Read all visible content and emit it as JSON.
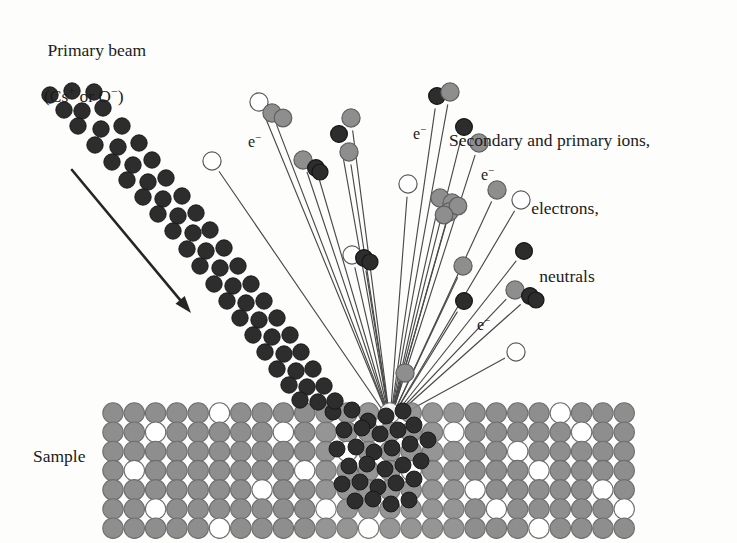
{
  "figure": {
    "kind": "sims-sputtering-schematic",
    "width": 737,
    "height": 543,
    "background": "#fdfdfc"
  },
  "labels": {
    "primary_beam": {
      "line1": "Primary beam",
      "line2": "(Cs+ or O−)",
      "line2_parts": {
        "open": "(Cs",
        "sup1": "+",
        "mid": " or O",
        "sup2": "−",
        "close": ")"
      }
    },
    "secondary": {
      "line1": "Secondary and primary ions,",
      "line2": "electrons,",
      "line3": "neutrals"
    },
    "sample": "Sample",
    "electron": "e",
    "electron_sup": "−"
  },
  "colors": {
    "ink": "#1b1b1b",
    "beam_particle": "#2d2d2d",
    "beam_particle_edge": "#151515",
    "lattice_atom": "#8e8e8e",
    "lattice_atom_edge": "#6f6f6f",
    "vacancy_fill": "#ffffff",
    "vacancy_edge": "#6f6f6f",
    "ejected_gray": "#8e8e8e",
    "ejected_gray_edge": "#5f5f5f",
    "ejected_dark": "#2d2d2d",
    "ejected_open": "#ffffff",
    "ray": "#4a4a4a",
    "arrow": "#262626",
    "background": "#fdfdfc"
  },
  "geometry": {
    "impact_point": {
      "x": 390,
      "y": 421
    },
    "arrow": {
      "x1": 72,
      "y1": 170,
      "x2": 191,
      "y2": 313,
      "width": 2.6
    },
    "lattice": {
      "x_start": 113,
      "y_start": 413,
      "pitch_x": 21.3,
      "pitch_y": 19.2,
      "radius": 10.2,
      "cols": 25,
      "rows": 7,
      "vacancies": [
        [
          0,
          5
        ],
        [
          0,
          13
        ],
        [
          0,
          21
        ],
        [
          1,
          2
        ],
        [
          1,
          8
        ],
        [
          1,
          16
        ],
        [
          1,
          22
        ],
        [
          2,
          11
        ],
        [
          2,
          19
        ],
        [
          3,
          1
        ],
        [
          3,
          9
        ],
        [
          3,
          14
        ],
        [
          3,
          20
        ],
        [
          4,
          7
        ],
        [
          4,
          17
        ],
        [
          4,
          23
        ],
        [
          5,
          2
        ],
        [
          5,
          10
        ],
        [
          5,
          18
        ],
        [
          5,
          24
        ],
        [
          6,
          5
        ],
        [
          6,
          12
        ],
        [
          6,
          20
        ]
      ],
      "crater_cols": [
        10,
        11,
        12,
        13,
        14,
        15,
        16
      ]
    }
  },
  "chart_data": {
    "type": "scatter",
    "beam_particles": [
      [
        50,
        95
      ],
      [
        72,
        91
      ],
      [
        94,
        92
      ],
      [
        64,
        110
      ],
      [
        82,
        111
      ],
      [
        103,
        108
      ],
      [
        78,
        126
      ],
      [
        101,
        129
      ],
      [
        122,
        126
      ],
      [
        95,
        145
      ],
      [
        118,
        147
      ],
      [
        139,
        143
      ],
      [
        112,
        162
      ],
      [
        133,
        165
      ],
      [
        152,
        160
      ],
      [
        127,
        180
      ],
      [
        148,
        182
      ],
      [
        166,
        178
      ],
      [
        143,
        197
      ],
      [
        163,
        199
      ],
      [
        182,
        196
      ],
      [
        158,
        214
      ],
      [
        178,
        216
      ],
      [
        196,
        213
      ],
      [
        173,
        231
      ],
      [
        193,
        233
      ],
      [
        210,
        230
      ],
      [
        187,
        249
      ],
      [
        206,
        251
      ],
      [
        224,
        248
      ],
      [
        200,
        266
      ],
      [
        220,
        268
      ],
      [
        238,
        266
      ],
      [
        214,
        284
      ],
      [
        233,
        286
      ],
      [
        251,
        284
      ],
      [
        227,
        301
      ],
      [
        246,
        303
      ],
      [
        264,
        301
      ],
      [
        240,
        318
      ],
      [
        259,
        320
      ],
      [
        277,
        318
      ],
      [
        253,
        335
      ],
      [
        272,
        337
      ],
      [
        290,
        335
      ],
      [
        265,
        352
      ],
      [
        284,
        354
      ],
      [
        301,
        352
      ],
      [
        277,
        369
      ],
      [
        296,
        371
      ],
      [
        313,
        369
      ],
      [
        289,
        385
      ],
      [
        307,
        387
      ],
      [
        324,
        386
      ],
      [
        300,
        400
      ],
      [
        318,
        402
      ],
      [
        335,
        401
      ]
    ],
    "crater_particles": [
      [
        333,
        412
      ],
      [
        352,
        410
      ],
      [
        368,
        421
      ],
      [
        386,
        416
      ],
      [
        403,
        411
      ],
      [
        344,
        430
      ],
      [
        362,
        428
      ],
      [
        380,
        434
      ],
      [
        398,
        430
      ],
      [
        414,
        425
      ],
      [
        337,
        449
      ],
      [
        356,
        447
      ],
      [
        374,
        452
      ],
      [
        392,
        448
      ],
      [
        410,
        444
      ],
      [
        428,
        440
      ],
      [
        349,
        466
      ],
      [
        367,
        464
      ],
      [
        385,
        469
      ],
      [
        403,
        465
      ],
      [
        421,
        461
      ],
      [
        342,
        484
      ],
      [
        360,
        482
      ],
      [
        378,
        487
      ],
      [
        396,
        483
      ],
      [
        414,
        479
      ],
      [
        355,
        501
      ],
      [
        373,
        499
      ],
      [
        391,
        504
      ],
      [
        409,
        500
      ]
    ],
    "rays": [
      {
        "x2": 212,
        "y2": 161,
        "tip": "open"
      },
      {
        "x2": 259,
        "y2": 102,
        "tip": "open"
      },
      {
        "x2": 272,
        "y2": 113,
        "tip": "gray"
      },
      {
        "x2": 303,
        "y2": 160,
        "tip": "gray"
      },
      {
        "x2": 316,
        "y2": 168,
        "tip": "dark"
      },
      {
        "x2": 339,
        "y2": 134,
        "tip": "dark"
      },
      {
        "x2": 351,
        "y2": 118,
        "tip": "gray"
      },
      {
        "x2": 349,
        "y2": 152,
        "tip": "gray"
      },
      {
        "x2": 352,
        "y2": 255,
        "tip": "open"
      },
      {
        "x2": 364,
        "y2": 258,
        "tip": "dark"
      },
      {
        "x2": 408,
        "y2": 184,
        "tip": "open"
      },
      {
        "x2": 437,
        "y2": 96,
        "tip": "dark"
      },
      {
        "x2": 450,
        "y2": 92,
        "tip": "gray"
      },
      {
        "x2": 464,
        "y2": 127,
        "tip": "dark"
      },
      {
        "x2": 479,
        "y2": 143,
        "tip": "gray"
      },
      {
        "x2": 440,
        "y2": 198,
        "tip": "gray"
      },
      {
        "x2": 452,
        "y2": 203,
        "tip": "gray"
      },
      {
        "x2": 449,
        "y2": 212,
        "tip": "gray"
      },
      {
        "x2": 497,
        "y2": 190,
        "tip": "gray"
      },
      {
        "x2": 521,
        "y2": 200,
        "tip": "open"
      },
      {
        "x2": 524,
        "y2": 251,
        "tip": "dark"
      },
      {
        "x2": 463,
        "y2": 266,
        "tip": "gray"
      },
      {
        "x2": 515,
        "y2": 290,
        "tip": "gray"
      },
      {
        "x2": 530,
        "y2": 296,
        "tip": "dark"
      },
      {
        "x2": 464,
        "y2": 301,
        "tip": "dark"
      },
      {
        "x2": 405,
        "y2": 373,
        "tip": "gray"
      },
      {
        "x2": 516,
        "y2": 352,
        "tip": "open"
      }
    ],
    "electron_labels": [
      {
        "x": 248,
        "y": 131
      },
      {
        "x": 413,
        "y": 123
      },
      {
        "x": 481,
        "y": 164
      },
      {
        "x": 477,
        "y": 314
      }
    ]
  }
}
